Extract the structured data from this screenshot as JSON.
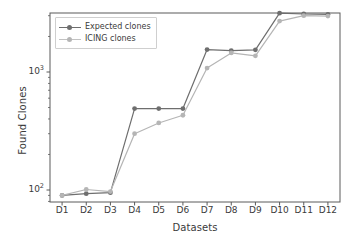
{
  "chart_data": {
    "type": "line",
    "title": "",
    "xlabel": "Datasets",
    "ylabel": "Found Clones",
    "categories": [
      "D1",
      "D2",
      "D3",
      "D4",
      "D5",
      "D6",
      "D7",
      "D8",
      "D9",
      "D10",
      "D11",
      "D12"
    ],
    "yscale": "log",
    "ylim": [
      80,
      3800
    ],
    "yticks": [
      "10",
      "10"
    ],
    "ytick_labels": [
      "10²",
      "10³"
    ],
    "ytick_values": [
      100,
      1000
    ],
    "ytick_base": "10",
    "ytick_exponents": [
      "2",
      "3"
    ],
    "grid": false,
    "legend_position": "upper left",
    "series": [
      {
        "name": "Expected clones",
        "color": "#6e6e6e",
        "marker": "circle",
        "values": [
          90,
          93,
          95,
          490,
          490,
          490,
          1550,
          1520,
          1540,
          3150,
          3100,
          3080
        ]
      },
      {
        "name": "ICING clones",
        "color": "#b5b5b5",
        "marker": "circle",
        "values": [
          90,
          101,
          97,
          300,
          370,
          430,
          1080,
          1450,
          1370,
          2700,
          3000,
          2980
        ]
      }
    ]
  },
  "axes": {
    "xlabel": "Datasets",
    "ylabel": "Found Clones"
  },
  "legend": {
    "items": [
      {
        "label": "Expected clones"
      },
      {
        "label": "ICING clones"
      }
    ]
  },
  "colors": {
    "series_expected": "#6e6e6e",
    "series_icing": "#b5b5b5",
    "axis": "#3b3b3b",
    "frame": "#5a5a5a",
    "background": "#ffffff"
  }
}
